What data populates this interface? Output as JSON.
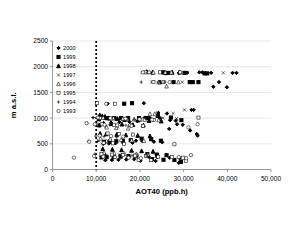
{
  "chart_data": {
    "type": "scatter",
    "title": "",
    "xlabel": "AOT40 (ppb.h)",
    "ylabel": "m a.s.l.",
    "xlim": [
      0,
      50000
    ],
    "ylim": [
      0,
      2500
    ],
    "xticks": [
      0,
      10000,
      20000,
      30000,
      40000,
      50000
    ],
    "xtick_labels": [
      "0",
      "10,000",
      "20,000",
      "30,000",
      "40,000",
      "50,000"
    ],
    "yticks": [
      0,
      500,
      1000,
      1500,
      2000,
      2500
    ],
    "ytick_labels": [
      "0",
      "500",
      "1000",
      "1500",
      "2000",
      "2500"
    ],
    "grid": "horizontal",
    "legend_position": "top-left-inside",
    "annotations": [
      {
        "type": "vline",
        "x": 10000,
        "style": "dotted",
        "label": "AOT40 critical level 10,000 ppb.h"
      }
    ],
    "series": [
      {
        "name": "2000",
        "marker": "filled-diamond",
        "points": [
          [
            12600,
            1280
          ],
          [
            20900,
            1290
          ],
          [
            24200,
            1100
          ],
          [
            26200,
            1090
          ],
          [
            31800,
            1160
          ],
          [
            32300,
            1160
          ],
          [
            28500,
            880
          ],
          [
            29800,
            870
          ],
          [
            26700,
            790
          ],
          [
            31500,
            760
          ],
          [
            33200,
            660
          ],
          [
            33000,
            690
          ],
          [
            21100,
            1010
          ],
          [
            22200,
            1010
          ],
          [
            24600,
            1000
          ],
          [
            26900,
            960
          ],
          [
            28200,
            950
          ],
          [
            19400,
            940
          ],
          [
            17600,
            930
          ],
          [
            15300,
            920
          ],
          [
            13400,
            910
          ],
          [
            11900,
            1000
          ],
          [
            12800,
            990
          ],
          [
            19100,
            560
          ],
          [
            20600,
            550
          ],
          [
            23200,
            540
          ],
          [
            25100,
            530
          ],
          [
            18300,
            520
          ],
          [
            16200,
            515
          ],
          [
            14400,
            510
          ],
          [
            12900,
            505
          ],
          [
            11600,
            500
          ],
          [
            22000,
            250
          ],
          [
            24000,
            240
          ],
          [
            26800,
            230
          ],
          [
            29100,
            220
          ],
          [
            18700,
            200
          ],
          [
            16900,
            195
          ],
          [
            15100,
            190
          ],
          [
            13600,
            185
          ],
          [
            12100,
            180
          ],
          [
            28900,
            130
          ],
          [
            23600,
            165
          ],
          [
            20100,
            170
          ],
          [
            35000,
            1880
          ],
          [
            36300,
            1880
          ],
          [
            41200,
            1880
          ],
          [
            42100,
            1880
          ],
          [
            38100,
            1700
          ],
          [
            36800,
            1610
          ],
          [
            39900,
            1600
          ],
          [
            33600,
            1890
          ],
          [
            34300,
            1890
          ],
          [
            30800,
            1880
          ],
          [
            28900,
            1880
          ]
        ]
      },
      {
        "name": "1999",
        "marker": "filled-square",
        "points": [
          [
            16400,
            1280
          ],
          [
            18200,
            1290
          ],
          [
            24100,
            1040
          ],
          [
            27100,
            1010
          ],
          [
            29500,
            960
          ],
          [
            21500,
            1000
          ],
          [
            19800,
            1000
          ],
          [
            17300,
            1000
          ],
          [
            15700,
            1000
          ],
          [
            14100,
            1000
          ],
          [
            12500,
            1000
          ],
          [
            11000,
            1010
          ],
          [
            20400,
            600
          ],
          [
            22600,
            590
          ],
          [
            24800,
            560
          ],
          [
            17900,
            570
          ],
          [
            16100,
            560
          ],
          [
            14600,
            550
          ],
          [
            13100,
            545
          ],
          [
            11800,
            540
          ],
          [
            21700,
            300
          ],
          [
            23900,
            290
          ],
          [
            26100,
            280
          ],
          [
            19200,
            270
          ],
          [
            17400,
            260
          ],
          [
            15600,
            250
          ],
          [
            14000,
            245
          ],
          [
            12400,
            240
          ],
          [
            11200,
            235
          ],
          [
            25400,
            190
          ],
          [
            27900,
            185
          ],
          [
            22800,
            200
          ],
          [
            29400,
            150
          ],
          [
            34800,
            1870
          ],
          [
            35400,
            1870
          ],
          [
            33400,
            1700
          ],
          [
            32100,
            1700
          ],
          [
            30200,
            1880
          ],
          [
            26500,
            1880
          ],
          [
            25300,
            1890
          ],
          [
            31400,
            1700
          ],
          [
            27700,
            1700
          ]
        ]
      },
      {
        "name": "1998",
        "marker": "filled-triangle",
        "points": [
          [
            11400,
            1040
          ],
          [
            12000,
            1030
          ],
          [
            13000,
            1000
          ],
          [
            14800,
            990
          ],
          [
            16500,
            970
          ],
          [
            19600,
            960
          ],
          [
            22100,
            950
          ],
          [
            24900,
            940
          ],
          [
            10800,
            1060
          ],
          [
            11700,
            900
          ],
          [
            13500,
            890
          ],
          [
            15900,
            880
          ],
          [
            18400,
            870
          ],
          [
            20800,
            860
          ],
          [
            10900,
            700
          ],
          [
            12300,
            690
          ],
          [
            14700,
            680
          ],
          [
            16800,
            670
          ],
          [
            19500,
            660
          ],
          [
            22300,
            650
          ],
          [
            11500,
            400
          ],
          [
            13700,
            390
          ],
          [
            15800,
            380
          ],
          [
            18100,
            370
          ],
          [
            20400,
            360
          ],
          [
            23000,
            350
          ],
          [
            24600,
            1700
          ],
          [
            25900,
            1880
          ],
          [
            27400,
            1890
          ],
          [
            29100,
            1890
          ],
          [
            22900,
            1890
          ],
          [
            21600,
            1900
          ],
          [
            10600,
            980
          ],
          [
            10700,
            860
          ]
        ]
      },
      {
        "name": "1997",
        "marker": "cross-x",
        "points": [
          [
            24100,
            1100
          ],
          [
            27600,
            1090
          ],
          [
            30200,
            1160
          ],
          [
            11300,
            1000
          ],
          [
            13800,
            990
          ],
          [
            16200,
            980
          ],
          [
            25300,
            1000
          ],
          [
            28400,
            990
          ],
          [
            12200,
            840
          ],
          [
            14900,
            830
          ],
          [
            10500,
            560
          ],
          [
            12700,
            555
          ],
          [
            23700,
            265
          ],
          [
            18900,
            270
          ],
          [
            15400,
            280
          ],
          [
            39100,
            1880
          ],
          [
            30900,
            1890
          ],
          [
            26900,
            1885
          ],
          [
            24800,
            1890
          ],
          [
            20500,
            1890
          ],
          [
            22700,
            1700
          ],
          [
            29700,
            1700
          ]
        ]
      },
      {
        "name": "1996",
        "marker": "open-triangle",
        "points": [
          [
            22300,
            1080
          ],
          [
            23400,
            1080
          ],
          [
            11600,
            1010
          ],
          [
            13900,
            1000
          ],
          [
            16100,
            990
          ],
          [
            18700,
            980
          ],
          [
            21100,
            970
          ],
          [
            24300,
            960
          ],
          [
            12400,
            820
          ],
          [
            14600,
            810
          ],
          [
            17300,
            800
          ],
          [
            11000,
            600
          ],
          [
            13200,
            590
          ],
          [
            15700,
            580
          ],
          [
            18100,
            570
          ],
          [
            20900,
            560
          ],
          [
            11800,
            330
          ],
          [
            14100,
            320
          ],
          [
            16500,
            310
          ],
          [
            19200,
            300
          ],
          [
            21800,
            290
          ],
          [
            23100,
            1890
          ],
          [
            25800,
            1890
          ],
          [
            27200,
            1890
          ],
          [
            28800,
            1700
          ],
          [
            24300,
            1700
          ],
          [
            26100,
            1620
          ]
        ]
      },
      {
        "name": "1995",
        "marker": "open-square",
        "points": [
          [
            14300,
            1280
          ],
          [
            10900,
            1000
          ],
          [
            13400,
            990
          ],
          [
            16900,
            980
          ],
          [
            20100,
            970
          ],
          [
            23200,
            960
          ],
          [
            33400,
            1010
          ],
          [
            11400,
            880
          ],
          [
            14100,
            870
          ],
          [
            17800,
            860
          ],
          [
            20700,
            850
          ],
          [
            12600,
            700
          ],
          [
            15200,
            690
          ],
          [
            18400,
            680
          ],
          [
            11700,
            520
          ],
          [
            13800,
            510
          ],
          [
            16400,
            500
          ],
          [
            27900,
            490
          ],
          [
            11200,
            300
          ],
          [
            13600,
            290
          ],
          [
            16100,
            280
          ],
          [
            18900,
            270
          ],
          [
            21400,
            260
          ],
          [
            24200,
            250
          ],
          [
            27300,
            240
          ],
          [
            29800,
            230
          ],
          [
            30500,
            170
          ],
          [
            22600,
            180
          ],
          [
            19700,
            185
          ],
          [
            21300,
            1890
          ],
          [
            24600,
            1890
          ],
          [
            29200,
            1890
          ],
          [
            25400,
            1700
          ],
          [
            23100,
            1700
          ],
          [
            10200,
            1290
          ]
        ]
      },
      {
        "name": "1994",
        "marker": "plus",
        "points": [
          [
            10200,
            1000
          ],
          [
            12300,
            990
          ],
          [
            15100,
            980
          ],
          [
            18700,
            970
          ],
          [
            9400,
            1010
          ],
          [
            10400,
            880
          ],
          [
            13100,
            870
          ],
          [
            16800,
            860
          ],
          [
            17900,
            845
          ],
          [
            9900,
            650
          ],
          [
            11800,
            640
          ],
          [
            14700,
            630
          ],
          [
            8200,
            550
          ],
          [
            10300,
            545
          ],
          [
            9700,
            300
          ],
          [
            12200,
            290
          ],
          [
            15400,
            280
          ],
          [
            18200,
            270
          ],
          [
            21600,
            260
          ],
          [
            8000,
            900
          ],
          [
            24200,
            1700
          ],
          [
            25700,
            1700
          ],
          [
            21700,
            1890
          ],
          [
            9200,
            1010
          ],
          [
            20300,
            1700
          ]
        ]
      },
      {
        "name": "1993",
        "marker": "open-circle",
        "points": [
          [
            12300,
            1280
          ],
          [
            7800,
            900
          ],
          [
            10400,
            1010
          ],
          [
            13200,
            1000
          ],
          [
            16700,
            990
          ],
          [
            19900,
            980
          ],
          [
            22800,
            970
          ],
          [
            33200,
            880
          ],
          [
            9700,
            880
          ],
          [
            11900,
            870
          ],
          [
            14800,
            860
          ],
          [
            18100,
            850
          ],
          [
            31100,
            820
          ],
          [
            10800,
            660
          ],
          [
            13400,
            650
          ],
          [
            16200,
            640
          ],
          [
            4900,
            230
          ],
          [
            9500,
            260
          ],
          [
            11600,
            250
          ],
          [
            14300,
            240
          ],
          [
            17400,
            230
          ],
          [
            20200,
            220
          ],
          [
            28900,
            240
          ],
          [
            30600,
            220
          ],
          [
            31700,
            280
          ],
          [
            22100,
            1890
          ],
          [
            26800,
            1700
          ],
          [
            20700,
            1890
          ],
          [
            8400,
            540
          ]
        ]
      }
    ]
  },
  "legend": {
    "entries": [
      {
        "label": "2000",
        "marker": "filled-diamond"
      },
      {
        "label": "1999",
        "marker": "filled-square"
      },
      {
        "label": "1998",
        "marker": "filled-triangle"
      },
      {
        "label": "1997",
        "marker": "cross-x"
      },
      {
        "label": "1996",
        "marker": "open-triangle"
      },
      {
        "label": "1995",
        "marker": "open-square"
      },
      {
        "label": "1994",
        "marker": "plus"
      },
      {
        "label": "1993",
        "marker": "open-circle"
      }
    ]
  },
  "colors": {
    "marker": "#000000",
    "grid": "#d9d9d9",
    "axis": "#808080",
    "background": "#ffffff",
    "threshold": "#000000"
  }
}
